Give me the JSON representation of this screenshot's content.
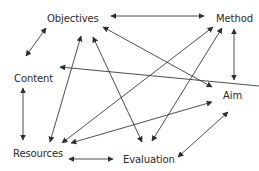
{
  "nodes": [
    {
      "id": "objectives",
      "label": "Objectives",
      "x": 47,
      "y": 13
    },
    {
      "id": "method",
      "label": "Method",
      "x": 216,
      "y": 13
    },
    {
      "id": "content",
      "label": "Content",
      "x": 14,
      "y": 73
    },
    {
      "id": "aim",
      "label": "Aim",
      "x": 223,
      "y": 90
    },
    {
      "id": "resources",
      "label": "Resources",
      "x": 13,
      "y": 148
    },
    {
      "id": "evaluation",
      "label": "Evaluation",
      "x": 123,
      "y": 154
    }
  ],
  "edges": [
    {
      "from": "objectives",
      "to": "method",
      "x1": 111,
      "y1": 16,
      "x2": 204,
      "y2": 16,
      "start_arrow": true,
      "end_arrow": true
    },
    {
      "from": "objectives",
      "to": "content",
      "x1": 46,
      "y1": 28,
      "x2": 26,
      "y2": 56,
      "start_arrow": true,
      "end_arrow": true
    },
    {
      "from": "content",
      "to": "resources",
      "x1": 23,
      "y1": 88,
      "x2": 23,
      "y2": 140,
      "start_arrow": true,
      "end_arrow": true
    },
    {
      "from": "method",
      "to": "aim",
      "x1": 234,
      "y1": 29,
      "x2": 234,
      "y2": 80,
      "start_arrow": true,
      "end_arrow": true
    },
    {
      "from": "resources",
      "to": "evaluation",
      "x1": 69,
      "y1": 159,
      "x2": 113,
      "y2": 159,
      "start_arrow": true,
      "end_arrow": true
    },
    {
      "from": "evaluation",
      "to": "aim",
      "x1": 178,
      "y1": 157,
      "x2": 228,
      "y2": 112,
      "start_arrow": true,
      "end_arrow": true
    },
    {
      "from": "aim",
      "to": "content",
      "x1": 259,
      "y1": 86,
      "x2": 60,
      "y2": 67,
      "start_arrow": false,
      "end_arrow": true
    },
    {
      "from": "objectives",
      "to": "aim",
      "x1": 103,
      "y1": 27,
      "x2": 212,
      "y2": 87,
      "start_arrow": true,
      "end_arrow": true
    },
    {
      "from": "resources",
      "to": "objectives",
      "x1": 50,
      "y1": 142,
      "x2": 81,
      "y2": 36,
      "start_arrow": true,
      "end_arrow": true
    },
    {
      "from": "evaluation",
      "to": "objectives",
      "x1": 142,
      "y1": 142,
      "x2": 93,
      "y2": 37,
      "start_arrow": true,
      "end_arrow": true
    },
    {
      "from": "resources",
      "to": "method",
      "x1": 62,
      "y1": 143,
      "x2": 213,
      "y2": 27,
      "start_arrow": true,
      "end_arrow": true
    },
    {
      "from": "resources",
      "to": "aim",
      "x1": 71,
      "y1": 143,
      "x2": 212,
      "y2": 102,
      "start_arrow": true,
      "end_arrow": true
    },
    {
      "from": "evaluation",
      "to": "method",
      "x1": 152,
      "y1": 141,
      "x2": 222,
      "y2": 28,
      "start_arrow": true,
      "end_arrow": true
    }
  ],
  "style": {
    "line_color": "#3a3a3a",
    "text_color": "#2a2a2a",
    "background": "#ffffff"
  }
}
